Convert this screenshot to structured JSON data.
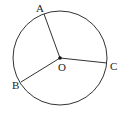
{
  "diagram": {
    "type": "geometry-circle",
    "center": {
      "label": "O",
      "x": 60,
      "y": 58
    },
    "radius": 47,
    "points": [
      {
        "label": "A",
        "x": 44,
        "y": 14,
        "label_x": 36,
        "label_y": 12
      },
      {
        "label": "B",
        "x": 21,
        "y": 82,
        "label_x": 12,
        "label_y": 89
      },
      {
        "label": "C",
        "x": 107,
        "y": 63,
        "label_x": 110,
        "label_y": 70
      }
    ],
    "center_label": {
      "x": 58,
      "y": 71
    },
    "segments": [
      "OA",
      "OB",
      "OC"
    ],
    "stroke_color": "#333333"
  }
}
